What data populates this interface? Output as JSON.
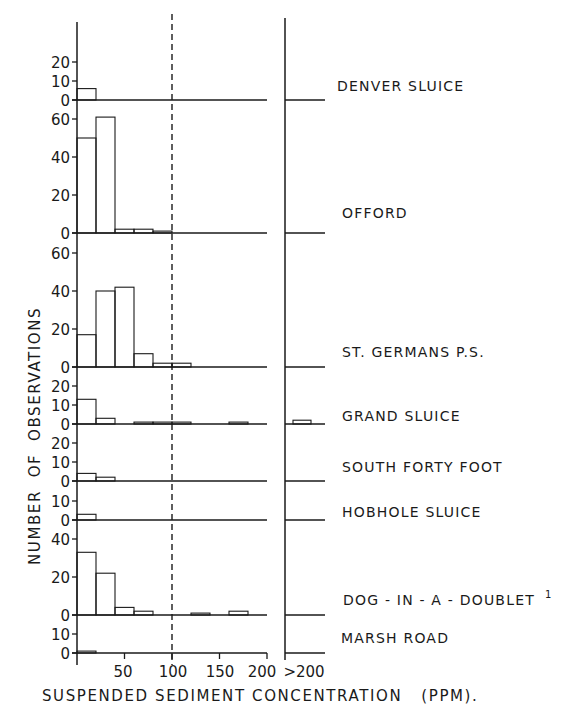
{
  "chart_data": {
    "type": "bar",
    "subtype": "stacked-panel histograms",
    "xlabel": "SUSPENDED SEDIMENT CONCENTRATION (PPM).",
    "ylabel": "NUMBER OF OBSERVATIONS",
    "x_ticks": [
      "50",
      "100",
      "150",
      "200"
    ],
    "overflow_label": ">200",
    "bin_width_ppm": 20,
    "bin_starts_ppm": [
      0,
      20,
      40,
      60,
      80,
      100,
      120,
      140,
      160,
      180
    ],
    "reference_line": {
      "x": 100,
      "style": "dashed"
    },
    "xlim": [
      0,
      200
    ],
    "grid": false,
    "legend": null,
    "panels": [
      {
        "name": "DENVER SLUICE",
        "y_ticks": [
          0,
          10,
          20
        ],
        "ylim": [
          0,
          20
        ],
        "values": [
          6,
          0,
          0,
          0,
          0,
          0,
          0,
          0,
          0,
          0
        ],
        "over_200": 0
      },
      {
        "name": "OFFORD",
        "y_ticks": [
          0,
          20,
          40,
          60
        ],
        "ylim": [
          0,
          60
        ],
        "values": [
          50,
          61,
          2,
          2,
          1,
          0,
          0,
          0,
          0,
          0
        ],
        "over_200": 0
      },
      {
        "name": "ST. GERMANS P.S.",
        "y_ticks": [
          0,
          20,
          40,
          60
        ],
        "ylim": [
          0,
          60
        ],
        "values": [
          17,
          40,
          42,
          7,
          2,
          2,
          0,
          0,
          0,
          0
        ],
        "over_200": 0
      },
      {
        "name": "GRAND SLUICE",
        "y_ticks": [
          0,
          10,
          20
        ],
        "ylim": [
          0,
          20
        ],
        "values": [
          13,
          3,
          0,
          1,
          1,
          1,
          0,
          0,
          1,
          0
        ],
        "over_200": 2
      },
      {
        "name": "SOUTH FORTY FOOT",
        "y_ticks": [
          0,
          10,
          20
        ],
        "ylim": [
          0,
          20
        ],
        "values": [
          4,
          2,
          0,
          0,
          0,
          0,
          0,
          0,
          0,
          0
        ],
        "over_200": 0
      },
      {
        "name": "HOBHOLE SLUICE",
        "y_ticks": [
          0,
          10
        ],
        "ylim": [
          0,
          10
        ],
        "values": [
          3,
          0,
          0,
          0,
          0,
          0,
          0,
          0,
          0,
          0
        ],
        "over_200": 0
      },
      {
        "name": "DOG-IN-A-DOUBLET",
        "footnote": "1",
        "y_ticks": [
          0,
          20,
          40
        ],
        "ylim": [
          0,
          40
        ],
        "values": [
          33,
          22,
          4,
          2,
          0,
          0,
          1,
          0,
          2,
          0
        ],
        "over_200": 0
      },
      {
        "name": "MARSH ROAD",
        "y_ticks": [
          0,
          10
        ],
        "ylim": [
          0,
          10
        ],
        "values": [
          1,
          0,
          0,
          0,
          0,
          0,
          0,
          0,
          0,
          0
        ],
        "over_200": 0
      }
    ]
  },
  "labels": {
    "stations": [
      "DENVER SLUICE",
      "OFFORD",
      "ST. GERMANS P.S.",
      "GRAND SLUICE",
      "SOUTH FORTY FOOT",
      "HOBHOLE SLUICE",
      "DOG - IN - A - DOUBLET",
      "MARSH ROAD"
    ],
    "footnote_marker": "1",
    "x_axis_title": "SUSPENDED SEDIMENT CONCENTRATION   (PPM).",
    "y_axis_title": "NUMBER  OF  OBSERVATIONS",
    "x_ticks": [
      "50",
      "100",
      "150",
      "200"
    ],
    "overflow_tick": ">200"
  },
  "colors": {
    "ink": "#1a1a1a",
    "background": "#ffffff"
  }
}
